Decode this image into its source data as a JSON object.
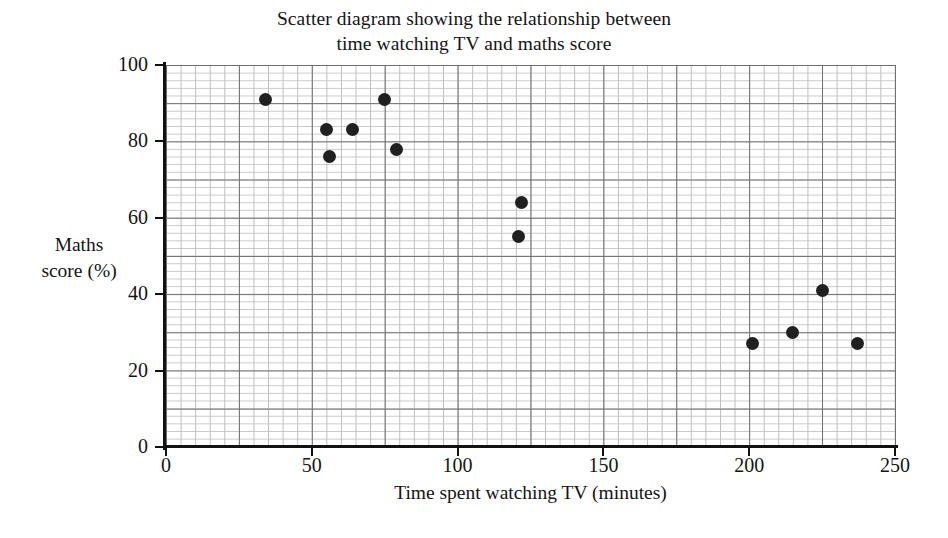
{
  "chart_data": {
    "type": "scatter",
    "title": "Scatter diagram showing the relationship between time watching TV and maths score",
    "title_lines": [
      "Scatter diagram showing the relationship between",
      "time watching TV and maths score"
    ],
    "xlabel": "Time spent watching TV (minutes)",
    "ylabel": "Maths score (%)",
    "ylabel_lines": [
      "Maths",
      "score (%)"
    ],
    "xlim": [
      0,
      250
    ],
    "ylim": [
      0,
      100
    ],
    "xticks": [
      0,
      50,
      100,
      150,
      200,
      250
    ],
    "yticks": [
      0,
      20,
      40,
      60,
      80,
      100
    ],
    "xtick_labels": [
      "0",
      "50",
      "100",
      "150",
      "200",
      "250"
    ],
    "ytick_labels": [
      "0",
      "20",
      "40",
      "60",
      "80",
      "100"
    ],
    "grid": true,
    "grid_minor_x_step": 5,
    "grid_minor_y_step": 2,
    "grid_major_x_step": 25,
    "grid_major_y_step": 10,
    "legend": null,
    "marker": "filled-circle",
    "marker_color": "#202020",
    "points": [
      {
        "x": 34,
        "y": 91
      },
      {
        "x": 55,
        "y": 83
      },
      {
        "x": 56,
        "y": 76
      },
      {
        "x": 64,
        "y": 83
      },
      {
        "x": 75,
        "y": 91
      },
      {
        "x": 79,
        "y": 78
      },
      {
        "x": 122,
        "y": 64
      },
      {
        "x": 121,
        "y": 55
      },
      {
        "x": 201,
        "y": 27
      },
      {
        "x": 215,
        "y": 30
      },
      {
        "x": 225,
        "y": 41
      },
      {
        "x": 237,
        "y": 27
      }
    ]
  },
  "colors": {
    "marker": "#202020",
    "axis": "#111111",
    "grid_major": "#6f6f6f",
    "grid_minor": "#c4c4c4",
    "text": "#141414",
    "background": "#ffffff"
  }
}
